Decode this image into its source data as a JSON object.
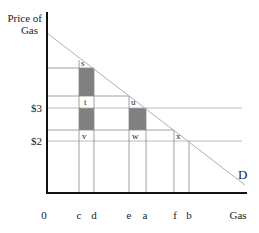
{
  "axes": {
    "y_label_line1": "Price of",
    "y_label_line2": "Gas",
    "x_label": "Gas",
    "origin_label": "0"
  },
  "price_labels": {
    "p3": "$3",
    "p2": "$2"
  },
  "quantity_labels": {
    "c": "c",
    "d": "d",
    "e": "e",
    "a": "a",
    "f": "f",
    "b": "b"
  },
  "points": {
    "s": "s",
    "t": "t",
    "u": "u",
    "v": "v",
    "w": "w",
    "x": "x"
  },
  "curve_label": "D",
  "colors": {
    "shade": "#808080",
    "axis": "#111111",
    "demand": "#b0b0b0",
    "gridline": "#999999"
  }
}
